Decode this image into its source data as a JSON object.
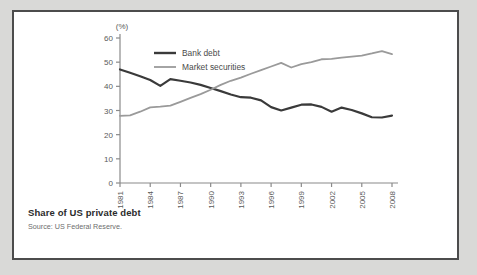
{
  "figure": {
    "caption_title": "Share of US private debt",
    "caption_source": "Source: US Federal Reserve."
  },
  "chart_data": {
    "type": "line",
    "title": "Share of US private debt",
    "subtitle": "",
    "xlabel": "",
    "ylabel": "(%)",
    "unit_label": "(%)",
    "xlim": [
      1981,
      2008
    ],
    "ylim": [
      0,
      60
    ],
    "ytick_values": [
      0,
      10,
      20,
      30,
      40,
      50,
      60
    ],
    "ytick_labels": [
      "0",
      "10",
      "20",
      "30",
      "40",
      "50",
      "60"
    ],
    "xtick_values": [
      1981,
      1984,
      1987,
      1990,
      1993,
      1996,
      1999,
      2002,
      2005,
      2008
    ],
    "xtick_labels": [
      "1981",
      "1984",
      "1987",
      "1990",
      "1993",
      "1996",
      "1999",
      "2002",
      "2005",
      "2008"
    ],
    "xtick_rotation": 90,
    "grid": false,
    "legend_position": "top-left-inside",
    "x": [
      1981,
      1982,
      1983,
      1984,
      1985,
      1986,
      1987,
      1988,
      1989,
      1990,
      1991,
      1992,
      1993,
      1994,
      1995,
      1996,
      1997,
      1998,
      1999,
      2000,
      2001,
      2002,
      2003,
      2004,
      2005,
      2006,
      2007,
      2008
    ],
    "series": [
      {
        "name": "Bank debt",
        "color": "#3a3a3a",
        "width": 2.2,
        "values": [
          47.0,
          45.6,
          44.2,
          42.6,
          40.2,
          43.0,
          42.3,
          41.6,
          40.6,
          39.3,
          38.0,
          36.6,
          35.5,
          35.3,
          34.2,
          31.4,
          30.0,
          31.2,
          32.4,
          32.5,
          31.5,
          29.5,
          31.2,
          30.2,
          28.8,
          27.2,
          27.1,
          27.9
        ]
      },
      {
        "name": "Market securities",
        "color": "#9a9a9a",
        "width": 1.8,
        "values": [
          27.8,
          28.0,
          29.5,
          31.3,
          31.6,
          32.0,
          33.6,
          35.2,
          36.8,
          38.6,
          40.6,
          42.3,
          43.6,
          45.2,
          46.7,
          48.2,
          49.7,
          47.8,
          49.2,
          50.0,
          51.2,
          51.4,
          51.9,
          52.3,
          52.7,
          53.6,
          54.6,
          53.3
        ]
      }
    ],
    "legend_entries": [
      {
        "label": "Bank debt",
        "color": "#3a3a3a"
      },
      {
        "label": "Market securities",
        "color": "#9a9a9a"
      }
    ],
    "axis_color": "#8a8a8a"
  }
}
